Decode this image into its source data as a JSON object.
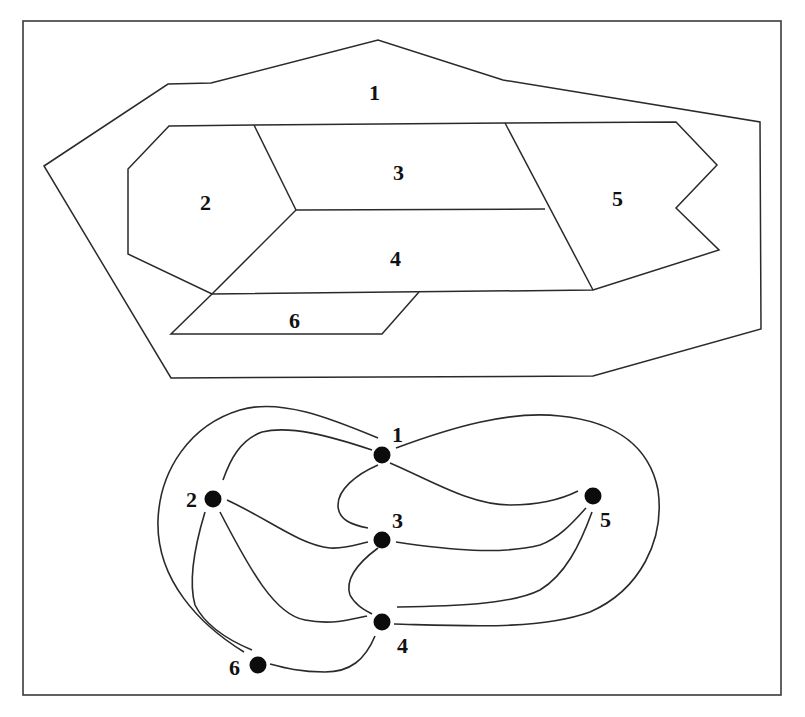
{
  "figure": {
    "colors": {
      "stroke": "#2a2a2a",
      "node": "#0c0c0c",
      "background": "#ffffff"
    }
  },
  "map": {
    "regions": [
      {
        "id": "1",
        "label": "1",
        "label_pos": [
          377,
          100
        ]
      },
      {
        "id": "2",
        "label": "2",
        "label_pos": [
          207,
          210
        ]
      },
      {
        "id": "3",
        "label": "3",
        "label_pos": [
          400,
          180
        ]
      },
      {
        "id": "4",
        "label": "4",
        "label_pos": [
          397,
          265
        ]
      },
      {
        "id": "5",
        "label": "5",
        "label_pos": [
          619,
          206
        ]
      },
      {
        "id": "6",
        "label": "6",
        "label_pos": [
          297,
          328
        ]
      }
    ]
  },
  "graph": {
    "nodes": [
      {
        "id": "1",
        "label": "1",
        "x": 382,
        "y": 455,
        "label_pos": [
          398,
          440
        ]
      },
      {
        "id": "2",
        "label": "2",
        "x": 213,
        "y": 499,
        "label_pos": [
          193,
          507
        ]
      },
      {
        "id": "3",
        "label": "3",
        "x": 382,
        "y": 540,
        "label_pos": [
          398,
          526
        ]
      },
      {
        "id": "4",
        "label": "4",
        "x": 382,
        "y": 622,
        "label_pos": [
          403,
          651
        ]
      },
      {
        "id": "5",
        "label": "5",
        "x": 593,
        "y": 496,
        "label_pos": [
          606,
          525
        ]
      },
      {
        "id": "6",
        "label": "6",
        "x": 258,
        "y": 665,
        "label_pos": [
          236,
          673
        ]
      }
    ],
    "edges": [
      [
        "1",
        "2"
      ],
      [
        "1",
        "2"
      ],
      [
        "1",
        "3"
      ],
      [
        "1",
        "5"
      ],
      [
        "1",
        "5"
      ],
      [
        "2",
        "3"
      ],
      [
        "2",
        "4"
      ],
      [
        "2",
        "6"
      ],
      [
        "2",
        "6"
      ],
      [
        "3",
        "4"
      ],
      [
        "3",
        "5"
      ],
      [
        "4",
        "5"
      ],
      [
        "4",
        "5"
      ],
      [
        "4",
        "6"
      ]
    ]
  }
}
